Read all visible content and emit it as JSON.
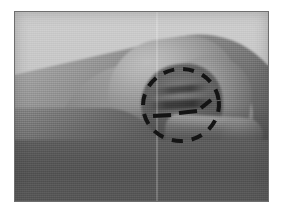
{
  "figure": {
    "domain_kind": "photograph",
    "description_alt": "Grayscale side-view photograph of a hand with the fingers curled into a fist and the index finger and thumb extended to the right, with a hand-drawn dashed ellipse circling the curled fingertips.",
    "color_mode": "grayscale",
    "border_color": "#6e6e6e",
    "page_background": "#ffffff",
    "photo_background": "#c6c6c6"
  },
  "photo": {
    "frame": {
      "x": 14,
      "y": 11,
      "width": 255,
      "height": 191
    },
    "regions": [
      {
        "name": "background-wall",
        "label": "Light gray studio backdrop",
        "tone": "#c6c6c6"
      },
      {
        "name": "hand-back",
        "label": "Back of the hand sloping down to the left",
        "tone": "#8e8e8e"
      },
      {
        "name": "knuckle-dome",
        "label": "Rounded knuckle ridge at the top of the fist",
        "tone": "#a2a2a2"
      },
      {
        "name": "curled-fingers",
        "label": "Curled finger segments forming the fist",
        "tone": "#6a6a6a"
      },
      {
        "name": "extended-finger",
        "label": "Index finger and thumb extended toward the right",
        "tone": "#9a9a9a"
      },
      {
        "name": "forearm-shadow",
        "label": "Shadowed wrist and forearm in the lower left",
        "tone": "#575757"
      }
    ]
  },
  "annotation": {
    "shape": "dashed-ellipse",
    "label": "Dashed ellipse highlighting the curled fingertip region",
    "stroke_color": "#141414",
    "stroke_width": 4,
    "dash_pattern": "11 9",
    "center_x": 166,
    "center_y": 93,
    "radius_x": 38,
    "radius_y": 36,
    "rotation_deg": -6,
    "inner_marks": [
      {
        "name": "inner-dash-left",
        "label": "Short dash over the middle finger crease",
        "x1": 138,
        "y1": 104,
        "x2": 156,
        "y2": 103
      },
      {
        "name": "inner-dash-right",
        "label": "Short dash over the index finger crease",
        "x1": 164,
        "y1": 101,
        "x2": 182,
        "y2": 99
      },
      {
        "name": "inner-dash-far-right",
        "label": "Short angled dash near the thumb joint",
        "x1": 186,
        "y1": 96,
        "x2": 196,
        "y2": 88
      }
    ]
  }
}
